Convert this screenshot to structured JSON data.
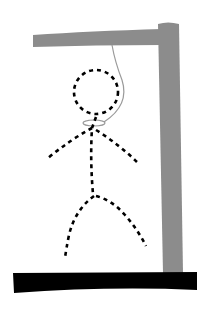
{
  "game": {
    "name": "hangman",
    "wrong_guesses_drawn": 6,
    "parts_drawn": [
      "head",
      "body",
      "left-arm",
      "right-arm",
      "left-leg",
      "right-leg"
    ],
    "part_style": "dashed",
    "colors": {
      "gallows": "#8c8c8c",
      "base": "#000000",
      "figure": "#000000",
      "rope": "#9a9a9a",
      "background": "#ffffff"
    }
  }
}
